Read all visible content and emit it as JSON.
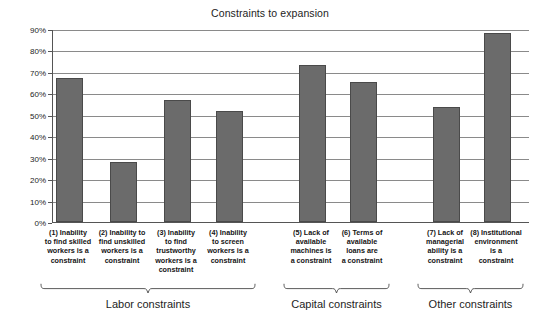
{
  "chart_data": {
    "type": "bar",
    "title": "Constraints to expansion",
    "xlabel": "",
    "ylabel": "",
    "ylim": [
      0,
      90
    ],
    "ytick_labels": [
      "0%",
      "10%",
      "20%",
      "30%",
      "40%",
      "50%",
      "60%",
      "70%",
      "80%",
      "90%"
    ],
    "ytick_values": [
      0,
      10,
      20,
      30,
      40,
      50,
      60,
      70,
      80,
      90
    ],
    "grid": true,
    "legend": "none",
    "bar_color": "#6b6b6b",
    "categories": [
      "(1) Inability to find skilled workers is a constraint",
      "(2) Inability to find unskilled workers is a constraint",
      "(3) Inability to find trustworthy workers is a constraint",
      "(4) Inability to screen workers is a constraint",
      "(5) Lack of available machines is a constraint",
      "(6) Terms of available loans are a constraint",
      "(7) Lack of managerial ability is a constraint",
      "(8) Institutional environment is a constraint"
    ],
    "values": [
      67,
      28,
      57,
      52,
      73,
      65.5,
      53.5,
      88
    ],
    "groups": [
      {
        "label": "Labor constraints",
        "members": [
          1,
          2,
          3,
          4
        ]
      },
      {
        "label": "Capital constraints",
        "members": [
          5,
          6
        ]
      },
      {
        "label": "Other constraints",
        "members": [
          7,
          8
        ]
      }
    ]
  },
  "axis": {
    "y_ticks": [
      {
        "label": "90%"
      },
      {
        "label": "80%"
      },
      {
        "label": "70%"
      },
      {
        "label": "60%"
      },
      {
        "label": "50%"
      },
      {
        "label": "40%"
      },
      {
        "label": "30%"
      },
      {
        "label": "20%"
      },
      {
        "label": "10%"
      },
      {
        "label": "0%"
      }
    ]
  },
  "bars": [
    {
      "label_lines": [
        "(1) Inability",
        "to find skilled",
        "workers is a",
        "constraint"
      ],
      "value": 67
    },
    {
      "label_lines": [
        "(2) Inability to",
        "find unskilled",
        "workers is a",
        "constraint"
      ],
      "value": 28
    },
    {
      "label_lines": [
        "(3) Inability",
        "to find",
        "trustworthy",
        "workers is a",
        "constraint"
      ],
      "value": 57
    },
    {
      "label_lines": [
        "(4) Inability",
        "to screen",
        "workers is a",
        "constraint"
      ],
      "value": 52
    },
    {
      "label_lines": [
        "(5) Lack of",
        "available",
        "machines is",
        "a constraint"
      ],
      "value": 73
    },
    {
      "label_lines": [
        "(6) Terms of",
        "available",
        "loans are",
        "a constraint"
      ],
      "value": 65.5
    },
    {
      "label_lines": [
        "(7) Lack of",
        "managerial",
        "ability is a",
        "constraint"
      ],
      "value": 53.5
    },
    {
      "label_lines": [
        "(8) Institutional",
        "environment",
        "is a",
        "constraint"
      ],
      "value": 88
    }
  ],
  "bar_labels_text": [
    "(1) Inability\nto find skilled\nworkers is a\nconstraint",
    "(2) Inability to\nfind unskilled\nworkers is a\nconstraint",
    "(3) Inability\nto find\ntrustworthy\nworkers is a\nconstraint",
    "(4) Inability\nto screen\nworkers is a\nconstraint",
    "(5) Lack of\navailable\nmachines is\na constraint",
    "(6) Terms of\navailable\nloans are\na constraint",
    "(7) Lack of\nmanagerial\nability is a\nconstraint",
    "(8) Institutional\nenvironment\nis a\nconstraint"
  ],
  "groups": [
    {
      "label": "Labor constraints"
    },
    {
      "label": "Capital constraints"
    },
    {
      "label": "Other constraints"
    }
  ]
}
